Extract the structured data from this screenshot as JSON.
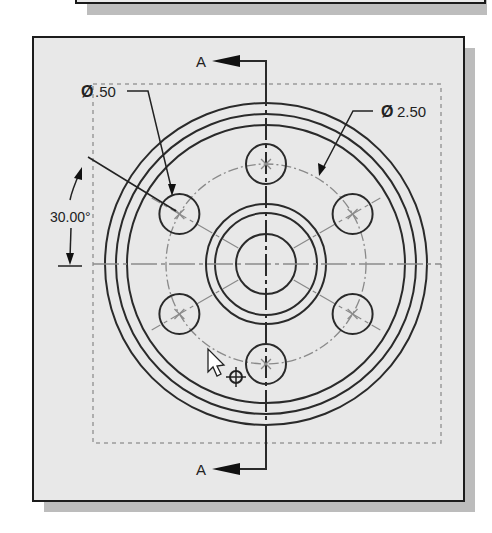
{
  "drawing": {
    "title": "Circular flange front view with section line",
    "section_label_top": "A",
    "section_label_bottom": "A",
    "hole_diameter_label_symbol": "Ø",
    "hole_diameter_label_value": ".50",
    "bolt_circle_label_symbol": "Ø",
    "bolt_circle_label_value": "2.50",
    "angle_label": "30.00°",
    "hole_count": 6,
    "hole_angles_deg": [
      90,
      30,
      -30,
      -90,
      -150,
      150
    ],
    "colors": {
      "background": "#e8e8e8",
      "line": "#2a2a2a",
      "centerline": "#8a8a8a",
      "shadow": "#bcbcbc"
    }
  }
}
